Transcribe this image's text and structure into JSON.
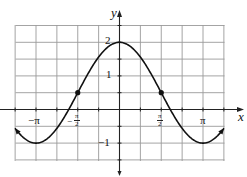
{
  "chart_data": {
    "type": "line",
    "title": "",
    "xlabel": "x",
    "ylabel": "y",
    "function": "y = 1.5cos(x) + 0.5",
    "xlim": [
      -3.93,
      3.93
    ],
    "ylim": [
      -1.5,
      2.5
    ],
    "grid": true,
    "grid_x_step": "π/4",
    "grid_y_step": 0.5,
    "x_tick_labels": [
      "−π",
      "−π/2",
      "π/2",
      "π"
    ],
    "y_tick_labels": [
      "2",
      "1",
      "−1"
    ],
    "highlighted_points": [
      {
        "x": "−π/2",
        "y": 0.5
      },
      {
        "x": "π/2",
        "y": 0.5
      }
    ],
    "key_points": [
      {
        "x": "−π",
        "y": -1
      },
      {
        "x": "0",
        "y": 2
      },
      {
        "x": "π",
        "y": -1
      }
    ],
    "ends": "arrows at both ends"
  },
  "labels": {
    "x_axis": "x",
    "y_axis": "y",
    "neg_pi": "−π",
    "pi": "π",
    "half_num": "π",
    "half_den": "2",
    "neg_sign": "−",
    "y2": "2",
    "y1": "1",
    "yneg1": "−1"
  },
  "colors": {
    "grid": "#9a9a9a",
    "axis": "#222222",
    "curve": "#111111"
  }
}
